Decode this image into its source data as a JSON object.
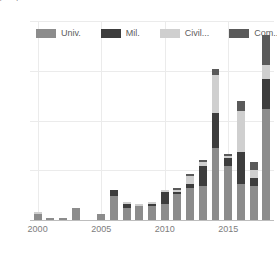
{
  "top_fragment": "⌐ ⌐",
  "chart_data": {
    "type": "bar",
    "title": "",
    "subtitle": "",
    "xlabel": "",
    "ylabel": "",
    "stacked": true,
    "grid": true,
    "legend_position": "top-inside",
    "ylim": [
      0,
      100
    ],
    "yticks": [
      0,
      25,
      50,
      75,
      100
    ],
    "ytick_labels": [
      "0",
      "25",
      "50",
      "75",
      "100"
    ],
    "xlim": [
      1999.4,
      2018.6
    ],
    "xticks": [
      2000,
      2005,
      2010,
      2015
    ],
    "xtick_labels": [
      "2000",
      "2005",
      "2010",
      "2015"
    ],
    "categories": [
      2000,
      2001,
      2002,
      2003,
      2004,
      2005,
      2006,
      2007,
      2008,
      2009,
      2010,
      2011,
      2012,
      2013,
      2014,
      2015,
      2016,
      2017,
      2018
    ],
    "series": [
      {
        "name": "Univ.",
        "color": "#8c8c8c",
        "values": [
          3,
          1,
          1,
          6,
          0,
          3,
          12,
          6,
          7,
          7,
          8,
          13,
          16,
          17,
          36,
          27,
          18,
          17,
          56
        ]
      },
      {
        "name": "Mil.",
        "color": "#3d3d3d",
        "values": [
          0,
          0,
          0,
          0,
          0,
          0,
          3,
          2,
          0,
          1,
          6,
          1,
          2,
          10,
          18,
          4,
          16,
          4,
          15
        ]
      },
      {
        "name": "Civil...",
        "color": "#cfcfcf",
        "values": [
          1,
          0,
          0,
          0,
          0,
          0,
          0,
          1,
          1,
          1,
          1,
          1,
          4,
          2,
          19,
          1,
          21,
          4,
          7
        ]
      },
      {
        "name": "Com...",
        "color": "#5a5a5a",
        "values": [
          0,
          0,
          0,
          0,
          0,
          0,
          0,
          0,
          0,
          0,
          0,
          1,
          1,
          1,
          3,
          1,
          5,
          4,
          15
        ]
      }
    ],
    "totals": [
      4,
      1,
      1,
      6,
      0,
      3,
      15,
      9,
      8,
      9,
      15,
      16,
      23,
      30,
      76,
      33,
      60,
      29,
      93
    ],
    "axis_color": "#bdbdbd",
    "grid_color": "#ebebeb",
    "tick_label_color": "#7d7d7d"
  }
}
